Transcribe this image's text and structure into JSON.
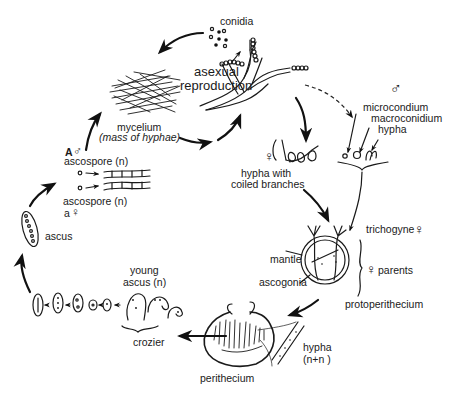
{
  "diagram": {
    "type": "life-cycle",
    "labels": {
      "conidia": "conidia",
      "asexual_1": "asexual",
      "asexual_2": "reproduction",
      "mycelium": "mycelium",
      "mycelium_sub": "(mass of hyphae)",
      "male_symbol": "♂",
      "microconidium": "microcondium",
      "macroconidium": "macroconidium",
      "hypha_male": "hypha",
      "female_symbol_coiled": "♀",
      "coiled_1": "hypha with",
      "coiled_2": "coiled branches",
      "trichogyne": "trichogyne",
      "trichogyne_symbol": "♀",
      "mantle": "mantle",
      "ascogonia": "ascogonia",
      "parents_symbol": "♀",
      "parents": "parents",
      "protoperithecium": "protoperithecium",
      "hypha_nn_1": "hypha",
      "hypha_nn_2": "(n+n )",
      "perithecium": "perithecium",
      "crozier": "crozier",
      "young_ascus_1": "young",
      "young_ascus_2": "ascus (n)",
      "ascus": "ascus",
      "ascospore_A_prefix": "A",
      "ascospore_A_symbol": "♂",
      "ascospore_1": "ascospore (n)",
      "ascospore_2": "ascospore (n)",
      "ascospore_a_prefix": "a",
      "ascospore_a_symbol": "♀"
    }
  }
}
